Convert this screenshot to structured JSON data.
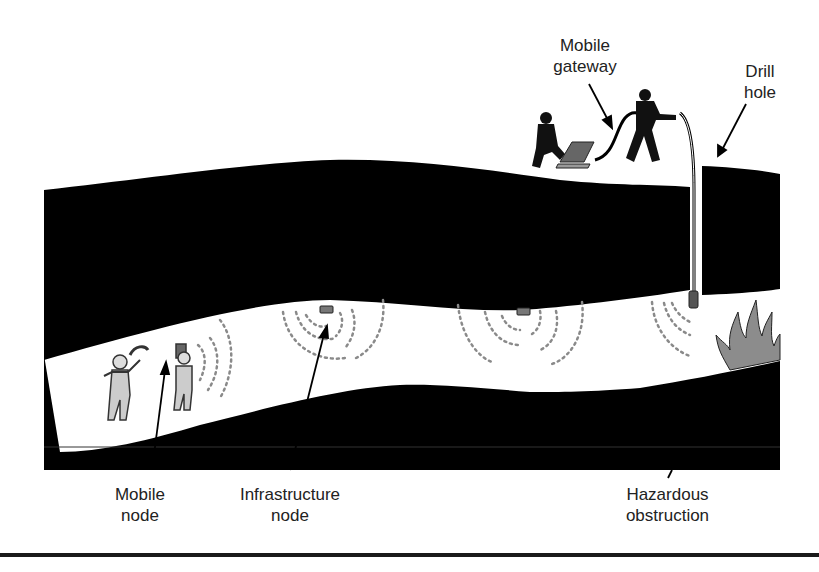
{
  "figure": {
    "type": "mine tunnel wireless network diagram",
    "colors": {
      "rock": "#000000",
      "tunnel": "#ffffff",
      "signal_dots": "#8a8a8a",
      "fire": "#8c8c8c",
      "text": "#222222",
      "rule": "#1a1a1a"
    }
  },
  "labels": {
    "mobile_gateway": "Mobile\ngateway",
    "drill_hole": "Drill\nhole",
    "mobile_node": "Mobile\nnode",
    "infrastructure_node": "Infrastructure\nnode",
    "hazardous_obstruction": "Hazardous\nobstruction"
  },
  "elements": {
    "miners": [
      "miner-with-pickaxe",
      "miner-with-radio"
    ],
    "infrastructure_nodes": 3,
    "surface_people": [
      "kneeling-operator-with-laptop",
      "person-lowering-cable"
    ],
    "icons": [
      "laptop-icon",
      "fire-icon",
      "person-icon",
      "signal-wave-icon",
      "sensor-node-icon"
    ]
  }
}
